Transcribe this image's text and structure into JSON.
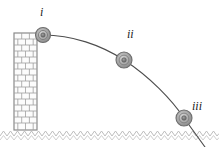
{
  "figure": {
    "width": 219,
    "height": 147,
    "background_color": "#ffffff"
  },
  "labels": {
    "position_1": "i",
    "position_2": "ii",
    "position_3": "iii"
  },
  "wall": {
    "name": "brick-wall",
    "x": 14,
    "y": 33,
    "width": 23,
    "height": 97,
    "outline_color": "#8a8a8a",
    "brick_color": "#9a9a9a",
    "fill_color": "#fbfbfb",
    "brick_rows": 16,
    "bond": "running-bond"
  },
  "ground": {
    "name": "ground-zigzag-line",
    "y": 133,
    "x_start": 0,
    "x_end": 219,
    "amplitude": 3,
    "period": 7,
    "color": "#b0b0b0"
  },
  "trajectory": {
    "name": "parabolic-path",
    "color": "#4a4a4a",
    "stroke_width": 1,
    "start": [
      43,
      35
    ],
    "end": [
      205,
      145
    ],
    "shape": "parabola"
  },
  "balls": [
    {
      "name": "ball-position-i",
      "label": "i",
      "cx": 43,
      "cy": 35,
      "r": 7.5,
      "outer_color": "#6e6e6e",
      "mid_color": "#b8b8b8",
      "inner_color": "#8f8f8f",
      "core_color": "#5c5c5c"
    },
    {
      "name": "ball-position-ii",
      "label": "ii",
      "cx": 124,
      "cy": 60,
      "r": 8,
      "outer_color": "#6e6e6e",
      "mid_color": "#b8b8b8",
      "inner_color": "#8f8f8f",
      "core_color": "#5c5c5c"
    },
    {
      "name": "ball-position-iii",
      "label": "iii",
      "cx": 184,
      "cy": 118,
      "r": 8,
      "outer_color": "#6e6e6e",
      "mid_color": "#b8b8b8",
      "inner_color": "#8f8f8f",
      "core_color": "#5c5c5c"
    }
  ]
}
